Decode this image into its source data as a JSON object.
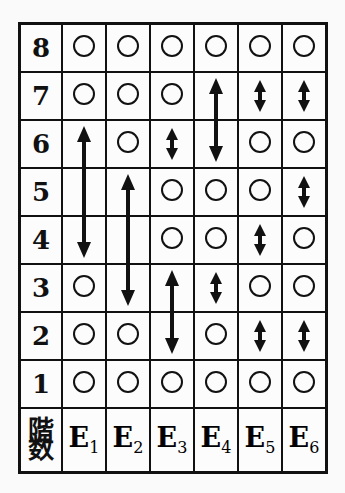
{
  "table": {
    "corner_label": [
      "階",
      "数"
    ],
    "columns": [
      {
        "base": "E",
        "sub": "1"
      },
      {
        "base": "E",
        "sub": "2"
      },
      {
        "base": "E",
        "sub": "3"
      },
      {
        "base": "E",
        "sub": "4"
      },
      {
        "base": "E",
        "sub": "5"
      },
      {
        "base": "E",
        "sub": "6"
      }
    ],
    "floors": [
      "8",
      "7",
      "6",
      "5",
      "4",
      "3",
      "2",
      "1"
    ],
    "cells_legend": {
      "circle": "stop",
      "arrow": "skip range"
    },
    "grid": {
      "E1": {
        "8": "circle",
        "7": "circle",
        "6": "arrow",
        "5": "arrow",
        "4": "arrow",
        "3": "circle",
        "2": "circle",
        "1": "circle"
      },
      "E2": {
        "8": "circle",
        "7": "circle",
        "6": "circle",
        "5": "arrow",
        "4": "arrow",
        "3": "arrow",
        "2": "circle",
        "1": "circle"
      },
      "E3": {
        "8": "circle",
        "7": "circle",
        "6": "arrow",
        "5": "circle",
        "4": "circle",
        "3": "arrow",
        "2": "arrow",
        "1": "circle"
      },
      "E4": {
        "8": "circle",
        "7": "arrow",
        "6": "arrow",
        "5": "circle",
        "4": "circle",
        "3": "arrow",
        "2": "circle",
        "1": "circle"
      },
      "E5": {
        "8": "circle",
        "7": "arrow",
        "6": "circle",
        "5": "circle",
        "4": "arrow",
        "3": "circle",
        "2": "arrow",
        "1": "circle"
      },
      "E6": {
        "8": "circle",
        "7": "arrow",
        "6": "circle",
        "5": "arrow",
        "4": "circle",
        "3": "circle",
        "2": "arrow",
        "1": "circle"
      }
    },
    "arrows": [
      {
        "column": "E1",
        "from_floor": "6",
        "to_floor": "4"
      },
      {
        "column": "E2",
        "from_floor": "5",
        "to_floor": "3"
      },
      {
        "column": "E3",
        "from_floor": "6",
        "to_floor": "6"
      },
      {
        "column": "E3",
        "from_floor": "3",
        "to_floor": "2"
      },
      {
        "column": "E4",
        "from_floor": "7",
        "to_floor": "6"
      },
      {
        "column": "E4",
        "from_floor": "3",
        "to_floor": "3"
      },
      {
        "column": "E5",
        "from_floor": "7",
        "to_floor": "7"
      },
      {
        "column": "E5",
        "from_floor": "4",
        "to_floor": "4"
      },
      {
        "column": "E5",
        "from_floor": "2",
        "to_floor": "2"
      },
      {
        "column": "E6",
        "from_floor": "7",
        "to_floor": "7"
      },
      {
        "column": "E6",
        "from_floor": "5",
        "to_floor": "5"
      },
      {
        "column": "E6",
        "from_floor": "2",
        "to_floor": "2"
      }
    ]
  }
}
